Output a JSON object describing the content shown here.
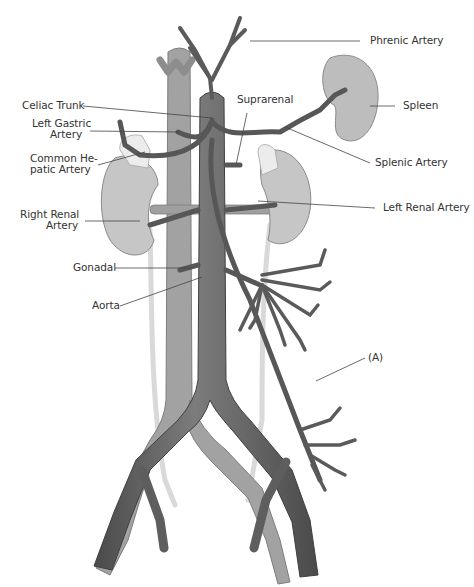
{
  "diagram": {
    "colors": {
      "artery_dark": "#5a5a5a",
      "artery_mid": "#7a7a7a",
      "vein": "#9a9a9a",
      "vein_light": "#b5b5b5",
      "kidney": "#c4c4c4",
      "spleen": "#bdbdbd",
      "adrenal": "#e8e8e8",
      "ureter": "#dcdcdc",
      "leader_line": "#444444",
      "label_text": "#333333"
    },
    "labels": {
      "phrenic_artery": "Phrenic Artery",
      "celiac_trunk": "Celiac Trunk",
      "suprarenal": "Suprarenal",
      "spleen": "Spleen",
      "left_gastric_1": "Left Gastric",
      "left_gastric_2": "Artery",
      "common_hepatic_1": "Common He-",
      "common_hepatic_2": "patic Artery",
      "splenic_artery": "Splenic Artery",
      "right_renal_1": "Right Renal",
      "right_renal_2": "Artery",
      "left_renal_artery": "Left Renal Artery",
      "gonadal": "Gonadal",
      "aorta": "Aorta",
      "a_marker": "(A)"
    }
  }
}
